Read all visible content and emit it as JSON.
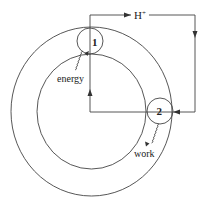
{
  "diagram": {
    "type": "proton-cycle schematic",
    "colors": {
      "stroke": "#444444",
      "text": "#222222",
      "background": "#ffffff"
    },
    "outer_ring": {
      "cx": 91.5,
      "cy": 111.5,
      "rx": 80.5,
      "ry": 84.5
    },
    "inner_ring": {
      "cx": 91.5,
      "cy": 111.5,
      "rx": 54.5,
      "ry": 57.5
    },
    "nodes": [
      {
        "id": "1",
        "label": "1",
        "cx": 90,
        "cy": 41,
        "r": 13
      },
      {
        "id": "2",
        "label": "2",
        "cx": 160,
        "cy": 111,
        "r": 13
      }
    ],
    "flow_label": {
      "text": "H",
      "superscript": "+"
    },
    "inputs": [
      {
        "node": "1",
        "label": "energy",
        "direction": "in"
      }
    ],
    "outputs": [
      {
        "node": "2",
        "label": "work",
        "direction": "out"
      }
    ],
    "arrows": [
      {
        "name": "rightward-top",
        "direction": "right"
      },
      {
        "name": "downward-right",
        "direction": "down"
      },
      {
        "name": "leftward-into-2",
        "direction": "left"
      },
      {
        "name": "upward-center",
        "direction": "up"
      }
    ]
  }
}
